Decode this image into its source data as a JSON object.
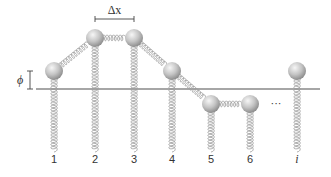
{
  "diagram": {
    "baseline_y": 89,
    "baseline_x": [
      36,
      320
    ],
    "ball_radius": 9,
    "spring_bottom_y": 152,
    "colors": {
      "line": "#888888",
      "spring": "#9a9a9a",
      "ball_light": "#f2f2f2",
      "ball_dark": "#8e8e8e",
      "text": "#333333"
    },
    "masses": [
      {
        "label": "1",
        "x": 54,
        "y": 71
      },
      {
        "label": "2",
        "x": 95,
        "y": 38
      },
      {
        "label": "3",
        "x": 134,
        "y": 38
      },
      {
        "label": "4",
        "x": 172,
        "y": 71
      },
      {
        "label": "5",
        "x": 211,
        "y": 104
      },
      {
        "label": "6",
        "x": 250,
        "y": 104
      },
      {
        "label": "i",
        "x": 297,
        "y": 71
      }
    ],
    "delta_x": {
      "label": "Δx",
      "from": 95,
      "to": 134,
      "y": 19
    },
    "phi": {
      "label": "ϕ",
      "x": 30,
      "y_top": 71,
      "y_bottom": 89
    },
    "ellipsis": {
      "label": "···",
      "x": 276,
      "y": 104
    },
    "index_labels_y": 163
  }
}
